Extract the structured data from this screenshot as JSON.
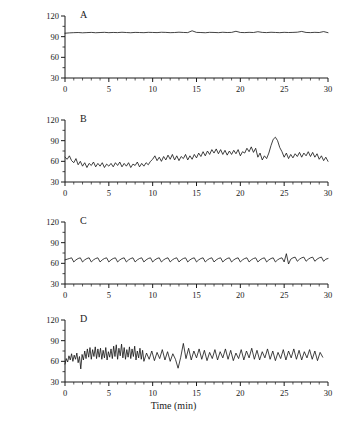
{
  "figure": {
    "y_axis_label": "Heart rate (bpm)",
    "x_axis_label": "Time (min)",
    "panel_labels": [
      "A",
      "B",
      "C",
      "D"
    ]
  },
  "axis": {
    "y_ticks": [
      30,
      60,
      90,
      120
    ],
    "x_ticks": [
      0,
      5,
      10,
      15,
      20,
      25,
      30
    ],
    "y_tick_labels": [
      "30",
      "60",
      "90",
      "120"
    ],
    "x_tick_labels": [
      "0",
      "5",
      "10",
      "15",
      "20",
      "25",
      "30"
    ],
    "line_color": "#1a1a1a",
    "trace_color": "#111111"
  },
  "chart_data": {
    "type": "line",
    "title": "",
    "xlabel": "Time (min)",
    "ylabel": "Heart rate (bpm)",
    "xlim": [
      0,
      30
    ],
    "ylim": [
      30,
      120
    ],
    "grid": false,
    "legend": "none",
    "panels": [
      {
        "label": "A",
        "description": "Near-constant heart rate, minimal variability",
        "mean_bpm": 96,
        "range_bpm": [
          93,
          101
        ],
        "x": [
          0,
          0.5,
          1,
          1.5,
          2,
          2.5,
          3,
          3.5,
          4,
          4.5,
          5,
          5.5,
          6,
          6.5,
          7,
          7.5,
          8,
          8.5,
          9,
          9.5,
          10,
          10.5,
          11,
          11.5,
          12,
          12.5,
          13,
          13.5,
          14,
          14.5,
          15,
          15.5,
          16,
          16.5,
          17,
          17.5,
          18,
          18.5,
          19,
          19.5,
          20,
          20.5,
          21,
          21.5,
          22,
          22.5,
          23,
          23.5,
          24,
          24.5,
          25,
          25.5,
          26,
          26.5,
          27,
          27.5,
          28,
          28.5,
          29,
          29.5,
          30
        ],
        "y": [
          95,
          95.5,
          95.8,
          96,
          95.6,
          95.9,
          96.2,
          95.7,
          96,
          96.3,
          95.8,
          96.1,
          95.9,
          96.4,
          96,
          95.7,
          96.2,
          96,
          95.8,
          96.3,
          96.1,
          95.9,
          96.4,
          96.2,
          95.8,
          96,
          96.5,
          96.1,
          95.9,
          98.5,
          96.2,
          96,
          95.7,
          96.3,
          96.1,
          95.8,
          96.4,
          96,
          96.2,
          97.8,
          96.1,
          95.9,
          96.3,
          96,
          97.2,
          96.2,
          95.9,
          96.4,
          96.1,
          95.8,
          96.3,
          96,
          96.2,
          96.5,
          97.6,
          96.1,
          95.9,
          96.3,
          96,
          97.4,
          95.8
        ]
      },
      {
        "label": "B",
        "description": "High variability with a sustained elevation near 24 min",
        "mean_bpm": 63,
        "range_bpm": [
          47,
          97
        ],
        "x": [
          0,
          0.25,
          0.5,
          0.75,
          1,
          1.25,
          1.5,
          1.75,
          2,
          2.25,
          2.5,
          2.75,
          3,
          3.25,
          3.5,
          3.75,
          4,
          4.25,
          4.5,
          4.75,
          5,
          5.25,
          5.5,
          5.75,
          6,
          6.25,
          6.5,
          6.75,
          7,
          7.25,
          7.5,
          7.75,
          8,
          8.25,
          8.5,
          8.75,
          9,
          9.25,
          9.5,
          9.75,
          10,
          10.25,
          10.5,
          10.75,
          11,
          11.25,
          11.5,
          11.75,
          12,
          12.25,
          12.5,
          12.75,
          13,
          13.25,
          13.5,
          13.75,
          14,
          14.25,
          14.5,
          14.75,
          15,
          15.25,
          15.5,
          15.75,
          16,
          16.25,
          16.5,
          16.75,
          17,
          17.25,
          17.5,
          17.75,
          18,
          18.25,
          18.5,
          18.75,
          19,
          19.25,
          19.5,
          19.75,
          20,
          20.25,
          20.5,
          20.75,
          21,
          21.25,
          21.5,
          21.75,
          22,
          22.25,
          22.5,
          22.75,
          23,
          23.25,
          23.5,
          23.75,
          24,
          24.25,
          24.5,
          24.75,
          25,
          25.25,
          25.5,
          25.75,
          26,
          26.25,
          26.5,
          26.75,
          27,
          27.25,
          27.5,
          27.75,
          28,
          28.25,
          28.5,
          28.75,
          29,
          29.25,
          29.5,
          29.75,
          30
        ],
        "y": [
          66,
          63,
          68,
          61,
          58,
          64,
          55,
          60,
          53,
          58,
          51,
          57,
          54,
          59,
          52,
          57,
          53,
          58,
          51,
          56,
          53,
          57,
          52,
          58,
          54,
          59,
          52,
          57,
          53,
          58,
          51,
          56,
          54,
          59,
          52,
          57,
          53,
          58,
          55,
          60,
          63,
          68,
          61,
          66,
          60,
          67,
          62,
          69,
          63,
          70,
          62,
          68,
          61,
          67,
          64,
          70,
          62,
          68,
          63,
          70,
          65,
          72,
          67,
          74,
          68,
          75,
          70,
          77,
          72,
          78,
          71,
          77,
          70,
          76,
          69,
          75,
          70,
          76,
          71,
          77,
          68,
          74,
          72,
          79,
          74,
          81,
          73,
          79,
          66,
          72,
          62,
          68,
          64,
          72,
          83,
          92,
          95,
          90,
          80,
          74,
          66,
          72,
          64,
          70,
          65,
          71,
          67,
          73,
          66,
          72,
          68,
          74,
          67,
          73,
          66,
          71,
          63,
          68,
          61,
          66,
          60
        ]
      },
      {
        "label": "C",
        "description": "Regular low-amplitude sawtooth oscillation, ~1 cycle per minute",
        "mean_bpm": 65,
        "range_bpm": [
          59,
          75
        ],
        "period_min": 1.0,
        "x": [
          0,
          0.25,
          0.5,
          0.75,
          1,
          1.25,
          1.5,
          1.75,
          2,
          2.25,
          2.5,
          2.75,
          3,
          3.25,
          3.5,
          3.75,
          4,
          4.25,
          4.5,
          4.75,
          5,
          5.25,
          5.5,
          5.75,
          6,
          6.25,
          6.5,
          6.75,
          7,
          7.25,
          7.5,
          7.75,
          8,
          8.25,
          8.5,
          8.75,
          9,
          9.25,
          9.5,
          9.75,
          10,
          10.25,
          10.5,
          10.75,
          11,
          11.25,
          11.5,
          11.75,
          12,
          12.25,
          12.5,
          12.75,
          13,
          13.25,
          13.5,
          13.75,
          14,
          14.25,
          14.5,
          14.75,
          15,
          15.25,
          15.5,
          15.75,
          16,
          16.25,
          16.5,
          16.75,
          17,
          17.25,
          17.5,
          17.75,
          18,
          18.25,
          18.5,
          18.75,
          19,
          19.25,
          19.5,
          19.75,
          20,
          20.25,
          20.5,
          20.75,
          21,
          21.25,
          21.5,
          21.75,
          22,
          22.25,
          22.5,
          22.75,
          23,
          23.25,
          23.5,
          23.75,
          24,
          24.25,
          24.5,
          24.75,
          25,
          25.25,
          25.5,
          25.75,
          26,
          26.25,
          26.5,
          26.75,
          27,
          27.25,
          27.5,
          27.75,
          28,
          28.25,
          28.5,
          28.75,
          29,
          29.25,
          29.5,
          29.75,
          30
        ],
        "y": [
          65,
          66,
          67,
          68,
          62,
          65,
          67,
          68,
          62,
          65,
          67,
          68,
          62,
          65,
          67,
          68,
          62,
          65,
          67,
          68,
          62,
          65,
          67,
          68,
          62,
          65,
          67,
          68,
          62,
          65,
          67,
          68,
          62,
          65,
          67,
          68,
          62,
          65,
          67,
          68,
          62,
          65,
          67,
          68,
          62,
          65,
          67,
          68,
          62,
          65,
          67,
          68,
          62,
          65,
          67,
          68,
          62,
          65,
          67,
          68,
          62,
          65,
          67,
          68,
          62,
          65,
          67,
          68,
          62,
          65,
          67,
          68,
          62,
          65,
          67,
          68,
          62,
          65,
          67,
          68,
          62,
          65,
          67,
          68,
          62,
          65,
          67,
          68,
          62,
          65,
          67,
          68,
          62,
          65,
          67,
          68,
          62,
          65,
          67,
          68,
          62,
          74,
          59,
          66,
          68,
          69,
          63,
          66,
          68,
          69,
          63,
          66,
          68,
          69,
          63,
          66,
          68,
          69,
          63,
          66,
          67
        ]
      },
      {
        "label": "D",
        "description": "Dense high-frequency beat-to-beat noise around a stable mean",
        "mean_bpm": 66,
        "range_bpm": [
          48,
          88
        ],
        "x": [
          0,
          0.15,
          0.3,
          0.45,
          0.6,
          0.75,
          0.9,
          1.05,
          1.2,
          1.35,
          1.5,
          1.65,
          1.8,
          1.95,
          2.1,
          2.25,
          2.4,
          2.55,
          2.7,
          2.85,
          3,
          3.15,
          3.3,
          3.45,
          3.6,
          3.75,
          3.9,
          4.05,
          4.2,
          4.35,
          4.5,
          4.65,
          4.8,
          4.95,
          5.1,
          5.25,
          5.4,
          5.55,
          5.7,
          5.85,
          6,
          6.15,
          6.3,
          6.45,
          6.6,
          6.75,
          6.9,
          7.05,
          7.2,
          7.35,
          7.5,
          7.65,
          7.8,
          7.95,
          8.1,
          8.25,
          8.4,
          8.55,
          8.7,
          8.85,
          9,
          9.3,
          9.6,
          9.9,
          10.2,
          10.5,
          10.8,
          11.1,
          11.4,
          11.7,
          12,
          12.3,
          12.6,
          12.9,
          13.2,
          13.5,
          13.8,
          14.1,
          14.4,
          14.7,
          15,
          15.3,
          15.6,
          15.9,
          16.2,
          16.5,
          16.8,
          17.1,
          17.4,
          17.7,
          18,
          18.3,
          18.6,
          18.9,
          19.2,
          19.5,
          19.8,
          20.1,
          20.4,
          20.7,
          21,
          21.3,
          21.6,
          21.9,
          22.2,
          22.5,
          22.8,
          23.1,
          23.4,
          23.7,
          24,
          24.3,
          24.6,
          24.9,
          25.2,
          25.5,
          25.8,
          26.1,
          26.4,
          26.7,
          27,
          27.3,
          27.6,
          27.9,
          28.2,
          28.5,
          28.8,
          29.1,
          29.4,
          29.7,
          30
        ],
        "y": [
          56,
          64,
          59,
          68,
          62,
          71,
          60,
          69,
          63,
          72,
          58,
          67,
          49,
          70,
          62,
          75,
          64,
          78,
          66,
          80,
          63,
          77,
          67,
          81,
          64,
          78,
          66,
          79,
          63,
          76,
          65,
          80,
          62,
          74,
          66,
          78,
          64,
          82,
          67,
          84,
          63,
          79,
          68,
          85,
          65,
          80,
          63,
          77,
          66,
          81,
          64,
          78,
          67,
          82,
          62,
          75,
          65,
          79,
          63,
          76,
          60,
          72,
          63,
          75,
          61,
          73,
          64,
          77,
          62,
          74,
          60,
          71,
          63,
          50,
          66,
          86,
          64,
          79,
          62,
          75,
          65,
          78,
          63,
          76,
          61,
          73,
          64,
          77,
          62,
          74,
          65,
          78,
          63,
          76,
          61,
          72,
          64,
          77,
          62,
          75,
          65,
          79,
          63,
          76,
          62,
          74,
          65,
          78,
          63,
          75,
          61,
          73,
          64,
          77,
          62,
          75,
          65,
          78,
          63,
          76,
          62,
          74,
          65,
          77,
          63,
          75,
          61,
          73,
          66
        ]
      }
    ]
  }
}
